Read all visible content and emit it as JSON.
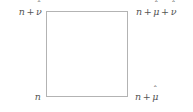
{
  "figure": {
    "type": "lattice-plaquette-diagram",
    "canvas": {
      "width": 193,
      "height": 112,
      "background_color": "#ffffff"
    },
    "square": {
      "name": "plaquette-square",
      "x": 46,
      "y": 11,
      "width": 82,
      "height": 86,
      "stroke_color": "#b3b3b3",
      "stroke_width": 1,
      "fill": "none"
    },
    "text_color": "#555555",
    "labels": {
      "top_left": {
        "id": "top-left",
        "plain": "n + nu-hat",
        "base": "n",
        "operator": "+",
        "term": "ν",
        "term_accent": "hat",
        "position": "top-left"
      },
      "top_right": {
        "id": "top-right",
        "plain": "n + mu-hat + nu-hat",
        "base": "n",
        "operator_1": "+",
        "term_1": "μ",
        "term_1_accent": "hat",
        "operator_2": "+",
        "term_2": "ν",
        "term_2_accent": "hat",
        "position": "top-right"
      },
      "bottom_left": {
        "id": "bottom-left",
        "plain": "n",
        "base": "n",
        "position": "bottom-left"
      },
      "bottom_right": {
        "id": "bottom-right",
        "plain": "n + mu-hat",
        "base": "n",
        "operator": "+",
        "term": "μ",
        "term_accent": "hat",
        "position": "bottom-right"
      }
    },
    "glyphs": {
      "hat": "ˆ",
      "plus": "+",
      "n": "n",
      "mu": "μ",
      "nu": "ν"
    }
  }
}
